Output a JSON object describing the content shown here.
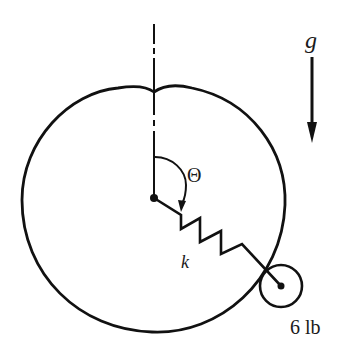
{
  "figure": {
    "type": "mechanics-diagram"
  },
  "labels": {
    "gravity": "g",
    "angle": "Θ",
    "spring_constant": "k",
    "mass": "6 lb"
  },
  "colors": {
    "stroke": "#111111",
    "background": "#ffffff"
  }
}
